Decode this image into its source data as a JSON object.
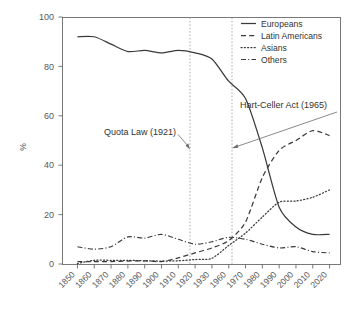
{
  "chart_data": {
    "type": "line",
    "title": "",
    "xlabel": "",
    "ylabel": "%",
    "ylim": [
      0,
      100
    ],
    "yticks": [
      0,
      20,
      40,
      60,
      80,
      100
    ],
    "grid": false,
    "legend_position": "top-right",
    "categories": [
      "1850",
      "1860",
      "1870",
      "1880",
      "1890",
      "1900",
      "1910",
      "1920",
      "1930",
      "1960",
      "1970",
      "1980",
      "1990",
      "2000",
      "2010",
      "2020"
    ],
    "series": [
      {
        "name": "Europeans",
        "style": "solid",
        "values": [
          92,
          92,
          89,
          86,
          86.5,
          85.5,
          86.5,
          85.5,
          83,
          74,
          67,
          47,
          23,
          15,
          12,
          12
        ]
      },
      {
        "name": "Latin Americans",
        "style": "dashed",
        "values": [
          1,
          1,
          1,
          1.2,
          1.3,
          1,
          2.5,
          4.5,
          6.5,
          9.5,
          17,
          35,
          46,
          50,
          54,
          52
        ]
      },
      {
        "name": "Asians",
        "style": "dotted",
        "values": [
          0.2,
          1.5,
          1.5,
          1.5,
          1.3,
          1.2,
          1.3,
          1.8,
          2.3,
          7.5,
          12.5,
          19,
          25,
          25.5,
          27,
          30
        ]
      },
      {
        "name": "Others",
        "style": "dash-dot",
        "values": [
          7,
          6,
          7,
          11,
          10.5,
          12,
          10,
          8,
          9,
          10.8,
          10,
          8,
          6.5,
          7,
          5,
          4.5
        ]
      }
    ],
    "annotations": [
      {
        "label": "Quota Law (1921)",
        "x_value": 1921,
        "y_value": 50,
        "marker": "vertical-dashed-line"
      },
      {
        "label": "Hart-Celler Act (1965)",
        "x_value": 1965,
        "y_value": 50,
        "marker": "vertical-dashed-line"
      }
    ]
  },
  "legend": {
    "items": [
      {
        "label": "Europeans"
      },
      {
        "label": "Latin Americans"
      },
      {
        "label": "Asians"
      },
      {
        "label": "Others"
      }
    ]
  },
  "axes": {
    "y_title": "%",
    "y_ticks": [
      "0",
      "20",
      "40",
      "60",
      "80",
      "100"
    ],
    "x_ticks": [
      "1850",
      "1860",
      "1870",
      "1880",
      "1890",
      "1900",
      "1910",
      "1920",
      "1930",
      "1960",
      "1970",
      "1980",
      "1990",
      "2000",
      "2010",
      "2020"
    ]
  },
  "colors": {
    "line": "#3a3a3a",
    "frame": "#6b6b6b",
    "guide": "#9a9a9a",
    "text": "#55595c",
    "background": "#ffffff"
  }
}
